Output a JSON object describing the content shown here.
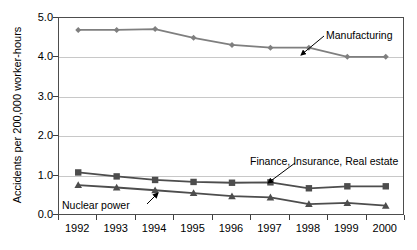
{
  "chart_data": {
    "type": "line",
    "title": "",
    "xlabel": "",
    "ylabel": "Accidents per 200,000 worker-hours",
    "categories": [
      "1992",
      "1993",
      "1994",
      "1995",
      "1996",
      "1997",
      "1998",
      "1999",
      "2000"
    ],
    "ylim": [
      0.0,
      5.0
    ],
    "ytick_labels": [
      "0.0",
      "1.0",
      "2.0",
      "3.0",
      "4.0",
      "5.0"
    ],
    "ytick_values": [
      0.0,
      1.0,
      2.0,
      3.0,
      4.0,
      5.0
    ],
    "grid": true,
    "legend": "inline-annotations",
    "series": [
      {
        "name": "Manufacturing",
        "marker": "diamond",
        "color": "#7f7f7f",
        "values": [
          4.7,
          4.7,
          4.72,
          4.5,
          4.32,
          4.25,
          4.25,
          4.02,
          4.02
        ]
      },
      {
        "name": "Finance, Insurance, Real estate",
        "marker": "square",
        "color": "#4d4d4d",
        "values": [
          1.1,
          1.0,
          0.91,
          0.86,
          0.84,
          0.85,
          0.7,
          0.75,
          0.75
        ]
      },
      {
        "name": "Nuclear power",
        "marker": "triangle",
        "color": "#4d4d4d",
        "values": [
          0.78,
          0.72,
          0.65,
          0.58,
          0.5,
          0.47,
          0.3,
          0.33,
          0.26
        ]
      }
    ],
    "annotations": [
      {
        "text": "Manufacturing",
        "x": 326,
        "y": 30
      },
      {
        "text": "Finance, Insurance, Real estate",
        "x": 250,
        "y": 156
      },
      {
        "text": "Nuclear power",
        "x": 62,
        "y": 200
      }
    ]
  }
}
